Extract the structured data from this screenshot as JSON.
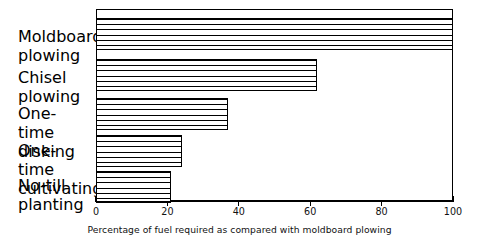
{
  "chart_data": {
    "type": "bar",
    "orientation": "horizontal",
    "title": "",
    "xlabel": "Percentage of fuel required as compared with moldboard plowing",
    "ylabel": "",
    "xlim": [
      0,
      100
    ],
    "xticks": [
      0,
      20,
      40,
      60,
      80,
      100
    ],
    "xtick_labels": [
      "0",
      "20",
      "40",
      "60",
      "80",
      "100"
    ],
    "grid": false,
    "legend": null,
    "categories": [
      "Moldboard\nplowing",
      "Chisel plowing",
      "One-time\ndisking",
      "One-time\ncultivating",
      "No-till\nplanting"
    ],
    "values": [
      100,
      62,
      37,
      24,
      21
    ],
    "series": [
      {
        "name": "Percentage of fuel required",
        "values": [
          100,
          62,
          37,
          24,
          21
        ]
      }
    ],
    "bar_style": {
      "fill": "#ffffff",
      "hatch": "horizontal-lines",
      "edge_color": "#000000"
    }
  },
  "axis": {
    "x_title": "Percentage of fuel required as compared with moldboard plowing",
    "tick_labels": [
      "0",
      "20",
      "40",
      "60",
      "80",
      "100"
    ]
  },
  "categories": [
    {
      "label": "Moldboard\nplowing",
      "value": 100
    },
    {
      "label": "Chisel plowing",
      "value": 62
    },
    {
      "label": "One-time\ndisking",
      "value": 37
    },
    {
      "label": "One-time\ncultivating",
      "value": 24
    },
    {
      "label": "No-till\nplanting",
      "value": 21
    }
  ],
  "colors": {
    "ink": "#000000",
    "background": "#ffffff"
  }
}
